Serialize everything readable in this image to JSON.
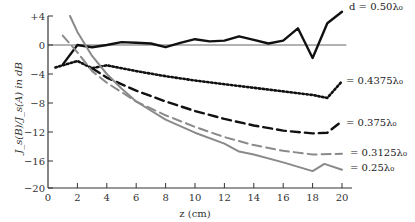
{
  "chart_data": {
    "type": "line",
    "title": "",
    "xlabel": "z (cm)",
    "ylabel": "J_s(B)/J_s(A) in dB",
    "xlim": [
      0,
      21
    ],
    "ylim": [
      -20,
      4
    ],
    "xticks": [
      0,
      2,
      4,
      6,
      8,
      10,
      12,
      14,
      16,
      18,
      20
    ],
    "yticks": [
      4,
      0,
      -4,
      -8,
      -12,
      -16,
      -20
    ],
    "ytick_labels": [
      "+4",
      "0",
      "−4",
      "−8",
      "−12",
      "−16",
      "−20"
    ],
    "grid": false,
    "reference_line_y": 0,
    "legend_position": "inline-right",
    "series": [
      {
        "name": "d = 0.50λ₀",
        "label": "d = 0.50λ₀",
        "style": "solid-thick",
        "color": "#111111",
        "x": [
          1,
          2,
          3,
          4,
          5,
          6,
          7,
          8,
          9,
          10,
          11,
          12,
          13,
          14,
          15,
          16,
          17,
          18,
          19,
          20
        ],
        "y": [
          -2.7,
          0.0,
          -0.3,
          0.0,
          0.4,
          0.3,
          0.2,
          -0.3,
          0.3,
          0.8,
          0.5,
          0.6,
          1.2,
          0.7,
          0.2,
          0.6,
          2.3,
          -1.8,
          3.0,
          4.6
        ]
      },
      {
        "name": "0.4375λ₀",
        "label": "= 0.4375λ₀",
        "style": "dotted",
        "color": "#111111",
        "x": [
          0.5,
          2,
          3,
          4,
          6,
          8,
          10,
          12,
          14,
          16,
          18,
          19,
          20
        ],
        "y": [
          -3.1,
          -2.2,
          -3.2,
          -2.8,
          -3.6,
          -4.3,
          -4.9,
          -5.4,
          -5.9,
          -6.4,
          -6.9,
          -7.3,
          -5.0
        ]
      },
      {
        "name": "0.375λ₀",
        "label": "= 0.375λ₀",
        "style": "dashed-thick",
        "color": "#111111",
        "x": [
          3,
          4,
          6,
          8,
          10,
          12,
          14,
          16,
          18,
          19,
          20
        ],
        "y": [
          -3.2,
          -4.5,
          -6.3,
          -7.8,
          -9.1,
          -10.2,
          -11.1,
          -11.8,
          -12.2,
          -12.1,
          -10.5
        ]
      },
      {
        "name": "0.3125λ₀",
        "label": "= 0.3125λ₀",
        "style": "dashed-gray",
        "color": "#888888",
        "x": [
          1,
          2,
          3,
          4,
          6,
          8,
          10,
          12,
          14,
          16,
          18,
          20
        ],
        "y": [
          1.3,
          -1.0,
          -3.6,
          -5.2,
          -7.8,
          -9.7,
          -11.3,
          -12.7,
          -13.8,
          -14.6,
          -15.1,
          -15.0
        ]
      },
      {
        "name": "0.25λ₀",
        "label": "= 0.25λ₀",
        "style": "solid-gray",
        "color": "#888888",
        "x": [
          1.5,
          2,
          3,
          4,
          5,
          6,
          8,
          10,
          12,
          13,
          14,
          16,
          18,
          18.8,
          20
        ],
        "y": [
          4.0,
          1.8,
          -1.5,
          -4.0,
          -6.0,
          -7.8,
          -10.3,
          -12.1,
          -13.6,
          -14.7,
          -15.1,
          -16.2,
          -17.4,
          -16.4,
          -17.2
        ]
      }
    ]
  }
}
